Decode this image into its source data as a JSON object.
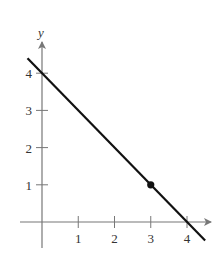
{
  "chart_data": {
    "type": "line",
    "title": "",
    "xlabel": "",
    "ylabel": "y",
    "xlim": [
      -0.5,
      4.6
    ],
    "ylim": [
      -0.6,
      4.8
    ],
    "x_ticks": [
      1,
      2,
      3,
      4
    ],
    "y_ticks": [
      1,
      2,
      3,
      4
    ],
    "x_tick_labels": [
      "1",
      "2",
      "3",
      "4"
    ],
    "y_tick_labels": [
      "1",
      "2",
      "3",
      "4"
    ],
    "grid": false,
    "legend": null,
    "series": [
      {
        "name": "line",
        "equation": "y = -x + 4",
        "x": [
          -0.4,
          4.5
        ],
        "y": [
          4.4,
          -0.5
        ],
        "color": "#111111"
      }
    ],
    "points": [
      {
        "x": 3,
        "y": 1,
        "label": "",
        "color": "#111111"
      }
    ]
  },
  "colors": {
    "axis": "#777777",
    "line": "#111111",
    "text": "#333333"
  }
}
